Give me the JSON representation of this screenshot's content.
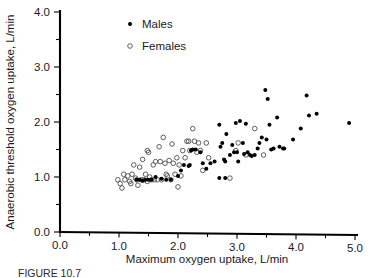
{
  "figure": {
    "caption_partial": "FIGURE 10.7",
    "legend_position": "top-left-inside"
  },
  "chart_data": {
    "type": "scatter",
    "title": "",
    "xlabel": "Maximum oxygen uptake, L/min",
    "ylabel": "Anaerobic threshold oxygen uptake, L/min",
    "xlim": [
      0.0,
      5.0
    ],
    "ylim": [
      0.0,
      4.0
    ],
    "xticks": [
      "0.0",
      "1.0",
      "2.0",
      "3.0",
      "4.0",
      "5.0"
    ],
    "xtick_values": [
      0.0,
      1.0,
      2.0,
      3.0,
      4.0,
      5.0
    ],
    "yticks": [
      "0.0",
      "1.0",
      "2.0",
      "3.0",
      "4.0"
    ],
    "ytick_values": [
      0.0,
      1.0,
      2.0,
      3.0,
      4.0
    ],
    "minor_tick_interval": 0.5,
    "grid": false,
    "legend_entries": [
      "Males",
      "Females"
    ],
    "colors": {
      "males_marker": "#000000",
      "females_marker": "#555555",
      "axis": "#000000",
      "background": "#ffffff"
    },
    "series": [
      {
        "name": "Males",
        "marker": "filled-circle",
        "points": [
          [
            1.3,
            0.95
          ],
          [
            1.35,
            0.95
          ],
          [
            1.4,
            0.93
          ],
          [
            1.45,
            0.95
          ],
          [
            1.5,
            0.95
          ],
          [
            1.55,
            0.95
          ],
          [
            1.62,
            1.0
          ],
          [
            1.72,
            0.97
          ],
          [
            1.8,
            0.95
          ],
          [
            1.88,
            0.95
          ],
          [
            2.0,
            1.02
          ],
          [
            2.05,
            1.12
          ],
          [
            2.1,
            1.22
          ],
          [
            2.18,
            1.2
          ],
          [
            2.2,
            1.22
          ],
          [
            2.22,
            1.48
          ],
          [
            2.25,
            1.5
          ],
          [
            2.3,
            1.5
          ],
          [
            2.38,
            1.45
          ],
          [
            2.42,
            1.25
          ],
          [
            2.48,
            1.15
          ],
          [
            2.55,
            1.25
          ],
          [
            2.62,
            1.28
          ],
          [
            2.7,
            0.98
          ],
          [
            2.7,
            1.95
          ],
          [
            2.72,
            1.55
          ],
          [
            2.75,
            1.62
          ],
          [
            2.78,
            1.32
          ],
          [
            2.8,
            0.98
          ],
          [
            2.8,
            1.28
          ],
          [
            2.82,
            1.78
          ],
          [
            2.88,
            1.4
          ],
          [
            2.92,
            1.58
          ],
          [
            2.95,
            1.45
          ],
          [
            2.98,
            1.98
          ],
          [
            3.0,
            1.45
          ],
          [
            3.02,
            1.28
          ],
          [
            3.05,
            2.02
          ],
          [
            3.1,
            1.62
          ],
          [
            3.12,
            1.42
          ],
          [
            3.15,
            1.97
          ],
          [
            3.18,
            1.45
          ],
          [
            3.22,
            1.4
          ],
          [
            3.25,
            1.38
          ],
          [
            3.3,
            1.4
          ],
          [
            3.35,
            1.52
          ],
          [
            3.38,
            1.62
          ],
          [
            3.42,
            1.72
          ],
          [
            3.48,
            2.58
          ],
          [
            3.5,
            1.68
          ],
          [
            3.52,
            2.42
          ],
          [
            3.55,
            1.95
          ],
          [
            3.58,
            1.5
          ],
          [
            3.62,
            1.52
          ],
          [
            3.68,
            2.08
          ],
          [
            3.72,
            1.55
          ],
          [
            3.78,
            1.52
          ],
          [
            3.8,
            1.52
          ],
          [
            3.95,
            1.68
          ],
          [
            4.08,
            1.88
          ],
          [
            4.18,
            2.48
          ],
          [
            4.22,
            2.12
          ],
          [
            4.35,
            2.15
          ],
          [
            4.9,
            1.98
          ]
        ]
      },
      {
        "name": "Females",
        "marker": "open-circle",
        "points": [
          [
            0.98,
            0.95
          ],
          [
            1.02,
            0.88
          ],
          [
            1.05,
            0.8
          ],
          [
            1.08,
            1.05
          ],
          [
            1.1,
            0.95
          ],
          [
            1.15,
            1.02
          ],
          [
            1.18,
            0.92
          ],
          [
            1.2,
            0.88
          ],
          [
            1.22,
            1.05
          ],
          [
            1.25,
            1.22
          ],
          [
            1.28,
            0.98
          ],
          [
            1.3,
            0.95
          ],
          [
            1.32,
            0.85
          ],
          [
            1.35,
            1.18
          ],
          [
            1.38,
            0.95
          ],
          [
            1.4,
            1.32
          ],
          [
            1.42,
            0.95
          ],
          [
            1.45,
            1.05
          ],
          [
            1.48,
            0.92
          ],
          [
            1.5,
            1.45
          ],
          [
            1.52,
            1.0
          ],
          [
            1.55,
            0.95
          ],
          [
            1.58,
            1.22
          ],
          [
            1.6,
            0.95
          ],
          [
            1.62,
            1.28
          ],
          [
            1.65,
            0.95
          ],
          [
            1.68,
            1.55
          ],
          [
            1.7,
            1.28
          ],
          [
            1.72,
            0.95
          ],
          [
            1.75,
            1.72
          ],
          [
            1.78,
            1.25
          ],
          [
            1.8,
            1.05
          ],
          [
            1.82,
            1.02
          ],
          [
            1.85,
            1.3
          ],
          [
            1.88,
            0.95
          ],
          [
            1.9,
            1.6
          ],
          [
            1.92,
            1.25
          ],
          [
            1.95,
            1.05
          ],
          [
            1.98,
            1.35
          ],
          [
            2.0,
            0.82
          ],
          [
            2.02,
            1.22
          ],
          [
            2.05,
            1.02
          ],
          [
            2.08,
            1.48
          ],
          [
            2.12,
            1.35
          ],
          [
            2.15,
            1.65
          ],
          [
            2.18,
            1.65
          ],
          [
            2.2,
            1.48
          ],
          [
            2.25,
            1.88
          ],
          [
            2.28,
            1.65
          ],
          [
            2.32,
            1.45
          ],
          [
            2.35,
            1.62
          ],
          [
            2.38,
            1.48
          ],
          [
            2.42,
            1.12
          ],
          [
            2.48,
            1.62
          ],
          [
            2.52,
            1.35
          ],
          [
            2.98,
            1.48
          ],
          [
            3.02,
            1.62
          ],
          [
            3.15,
            1.4
          ],
          [
            3.3,
            1.88
          ],
          [
            3.45,
            1.4
          ],
          [
            2.88,
            0.98
          ],
          [
            1.48,
            1.48
          ]
        ]
      }
    ]
  }
}
